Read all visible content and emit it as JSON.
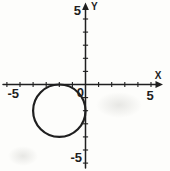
{
  "figure": {
    "title": "",
    "x_axis_name": "X",
    "y_axis_name": "Y",
    "origin_label": "0",
    "x_max_label": "5",
    "x_min_label": "-5",
    "y_max_label": "5",
    "y_min_label": "-5",
    "ink_color": "#1f1f1f",
    "paper_color": "#fdfdfb"
  },
  "chart_data": {
    "type": "line",
    "title": "",
    "xlabel": "X",
    "ylabel": "Y",
    "xlim": [
      -6.3,
      6
    ],
    "ylim": [
      -6.5,
      6.2
    ],
    "x_ticks": [
      -6,
      -5,
      -4,
      -3,
      -2,
      -1,
      1,
      2,
      3,
      4,
      5
    ],
    "y_ticks": [
      -6,
      -5,
      -4,
      -3,
      -2,
      -1,
      1,
      2,
      3,
      4,
      5
    ],
    "x_tick_labels": [
      {
        "value": -5,
        "label": "-5"
      },
      {
        "value": 5,
        "label": "5"
      }
    ],
    "y_tick_labels": [
      {
        "value": -5,
        "label": "-5"
      },
      {
        "value": 5,
        "label": "5"
      }
    ],
    "grid": false,
    "legend": null,
    "shapes": [
      {
        "kind": "circle",
        "center": [
          -2,
          -2
        ],
        "radius": 2,
        "fill": "none",
        "tangent_to": [
          "x-axis",
          "y-axis"
        ]
      }
    ]
  }
}
